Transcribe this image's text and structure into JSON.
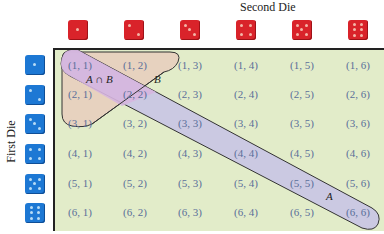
{
  "axes": {
    "top_label": "Second Die",
    "left_label": "First Die"
  },
  "dice": {
    "second_die_faces": [
      1,
      2,
      3,
      4,
      5,
      6
    ],
    "first_die_faces": [
      1,
      2,
      3,
      4,
      5,
      6
    ],
    "second_die_color": "#d9232a",
    "first_die_color": "#1d78d4"
  },
  "grid": {
    "rows": [
      [
        "(1, 1)",
        "(1, 2)",
        "(1, 3)",
        "(1, 4)",
        "(1, 5)",
        "(1, 6)"
      ],
      [
        "(2, 1)",
        "(2, 2)",
        "(2, 3)",
        "(2, 4)",
        "(2, 5)",
        "(2, 6)"
      ],
      [
        "(3, 1)",
        "(3, 2)",
        "(3, 3)",
        "(3, 4)",
        "(3, 5)",
        "(3, 6)"
      ],
      [
        "(4, 1)",
        "(4, 2)",
        "(4, 3)",
        "(4, 4)",
        "(4, 5)",
        "(4, 6)"
      ],
      [
        "(5, 1)",
        "(5, 2)",
        "(5, 3)",
        "(5, 4)",
        "(5, 5)",
        "(5, 6)"
      ],
      [
        "(6, 1)",
        "(6, 2)",
        "(6, 3)",
        "(6, 4)",
        "(6, 5)",
        "(6, 6)"
      ]
    ],
    "background_color": "#e2ecc9"
  },
  "events": {
    "A": {
      "label": "A",
      "description_cells": [
        "(1, 1)",
        "(2, 2)",
        "(3, 3)",
        "(4, 4)",
        "(5, 5)",
        "(6, 6)"
      ],
      "fill_color": "#c7c3e6"
    },
    "B": {
      "label": "B",
      "description_cells": [
        "(1, 1)",
        "(1, 2)",
        "(1, 3)",
        "(2, 1)",
        "(2, 2)",
        "(3, 1)"
      ],
      "fill_color": "#e7d2bf"
    },
    "A_and_B": {
      "label": "A ∩ B",
      "description_cells": [
        "(1, 1)",
        "(2, 2)"
      ],
      "fill_color": "#d6b6df"
    }
  }
}
